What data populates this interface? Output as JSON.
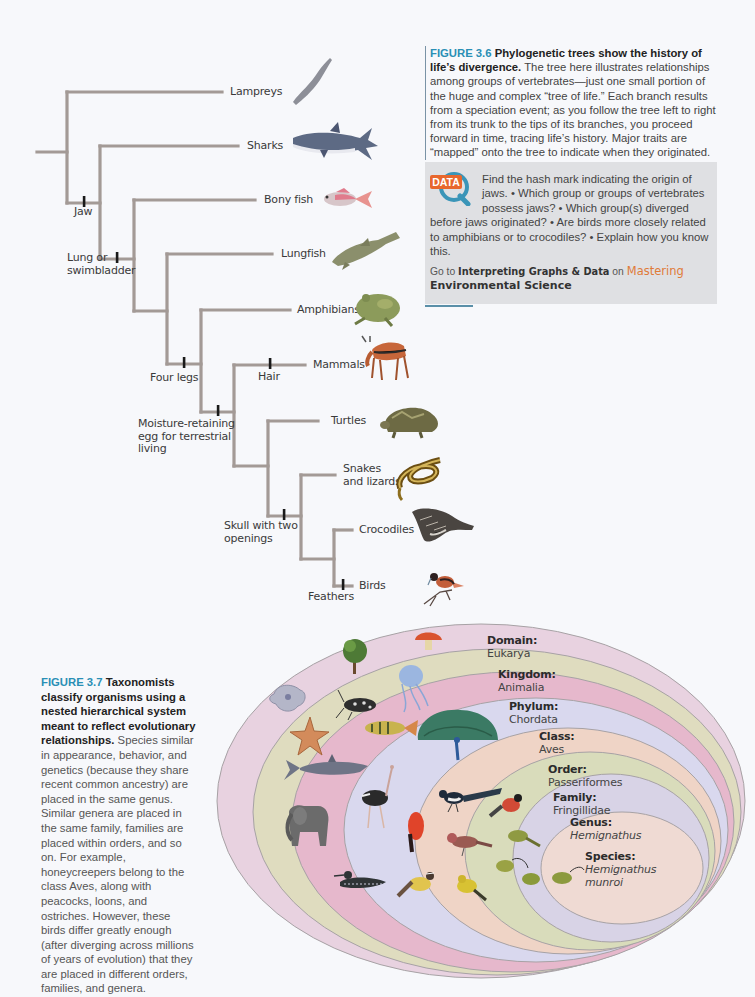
{
  "figure_3_6": {
    "number": "FIGURE 3.6",
    "title": "Phylogenetic trees show the history of life’s divergence.",
    "body": "The tree here illustrates relationships among groups of vertebrates—just one small portion of the huge and complex “tree of life.” Each branch results from a speciation event; as you follow the tree left to right from its trunk to the tips of its branches, you proceed forward in time, tracing life’s history. Major traits are “mapped” onto the tree to indicate when they originated.",
    "data_box": {
      "badge": "DATA",
      "questions": "Find the hash mark indicating the origin of jaws. • Which group or groups of vertebrates possess jaws? • Which group(s) diverged before jaws originated? • Are birds more closely related to amphibians or to crocodiles? • Explain how you know this.",
      "goto_prefix": "Go to",
      "goto_link": "Interpreting Graphs & Data",
      "goto_on": "on",
      "goto_brand": "Mastering",
      "goto_product": "Environmental Science"
    }
  },
  "tree": {
    "line_color": "#a39a96",
    "mark_color": "#1a1a1a",
    "taxa": [
      {
        "label": "Lampreys",
        "x": 230,
        "y": 85,
        "icon": "lamprey-icon"
      },
      {
        "label": "Sharks",
        "x": 247,
        "y": 139,
        "icon": "shark-icon"
      },
      {
        "label": "Bony fish",
        "x": 264,
        "y": 193,
        "icon": "bony-fish-icon"
      },
      {
        "label": "Lungfish",
        "x": 281,
        "y": 247,
        "icon": "lungfish-icon"
      },
      {
        "label": "Amphibians",
        "x": 297,
        "y": 303,
        "icon": "frog-icon"
      },
      {
        "label": "Mammals",
        "x": 313,
        "y": 358,
        "icon": "antelope-icon"
      },
      {
        "label": "Turtles",
        "x": 331,
        "y": 414,
        "icon": "turtle-icon"
      },
      {
        "label": "Snakes\nand lizards",
        "x": 343,
        "y": 462,
        "icon": "snake-icon"
      },
      {
        "label": "Crocodiles",
        "x": 359,
        "y": 523,
        "icon": "crocodile-icon"
      },
      {
        "label": "Birds",
        "x": 359,
        "y": 579,
        "icon": "bird-icon"
      }
    ],
    "traits": [
      {
        "label": "Jaw",
        "x": 74,
        "y": 206
      },
      {
        "label": "Lung or\nswimbladder",
        "x": 67,
        "y": 252
      },
      {
        "label": "Four legs",
        "x": 150,
        "y": 372
      },
      {
        "label": "Hair",
        "x": 258,
        "y": 371
      },
      {
        "label": "Moisture-retaining\negg for terrestrial\nliving",
        "x": 138,
        "y": 418
      },
      {
        "label": "Skull with two\nopenings",
        "x": 224,
        "y": 520
      },
      {
        "label": "Feathers",
        "x": 308,
        "y": 591
      }
    ],
    "segments": [
      [
        37,
        152,
        67,
        152
      ],
      [
        67,
        92,
        67,
        203
      ],
      [
        67,
        92,
        222,
        92
      ],
      [
        67,
        203,
        100,
        203
      ],
      [
        100,
        146,
        100,
        259
      ],
      [
        100,
        146,
        238,
        146
      ],
      [
        100,
        259,
        134,
        259
      ],
      [
        134,
        200,
        134,
        311
      ],
      [
        134,
        200,
        255,
        200
      ],
      [
        134,
        311,
        167,
        311
      ],
      [
        167,
        254,
        167,
        364
      ],
      [
        167,
        254,
        272,
        254
      ],
      [
        167,
        364,
        201,
        364
      ],
      [
        201,
        310,
        201,
        412
      ],
      [
        201,
        310,
        290,
        310
      ],
      [
        201,
        412,
        234,
        412
      ],
      [
        234,
        365,
        234,
        466
      ],
      [
        234,
        365,
        305,
        365
      ],
      [
        234,
        466,
        268,
        466
      ],
      [
        268,
        421,
        268,
        516
      ],
      [
        268,
        421,
        318,
        421
      ],
      [
        268,
        516,
        301,
        516
      ],
      [
        301,
        475,
        301,
        559
      ],
      [
        301,
        475,
        335,
        475
      ],
      [
        301,
        559,
        334,
        559
      ],
      [
        334,
        530,
        334,
        586
      ],
      [
        334,
        530,
        352,
        530
      ],
      [
        334,
        586,
        352,
        586
      ]
    ],
    "marks": [
      [
        84,
        203
      ],
      [
        117,
        259
      ],
      [
        184,
        364
      ],
      [
        218,
        412
      ],
      [
        270,
        365
      ],
      [
        284,
        516
      ],
      [
        343,
        586
      ]
    ]
  },
  "figure_3_7": {
    "number": "FIGURE 3.7",
    "title": "Taxonomists classify organisms using a nested hierarchical system meant to reflect evolutionary relationships.",
    "body": "Species similar in appearance, behavior, and genetics (because they share recent common ancestry) are placed in the same genus. Similar genera are placed in the same family, families are placed within orders, and so on. For example, honeycreepers belong to the class Aves, along with peacocks, loons, and ostriches. However, these birds differ greatly enough (after diverging across millions of years of evolution) that they are placed in different orders, families, and genera."
  },
  "taxonomy": {
    "levels": [
      {
        "rank": "Domain:",
        "name": "Eukarya",
        "italic": false,
        "color": "#e8d2e0",
        "x": 487,
        "y": 634
      },
      {
        "rank": "Kingdom:",
        "name": "Animalia",
        "italic": false,
        "color": "#dfdcbf",
        "x": 498,
        "y": 668
      },
      {
        "rank": "Phylum:",
        "name": "Chordata",
        "italic": false,
        "color": "#e6b8cc",
        "x": 509,
        "y": 700
      },
      {
        "rank": "Class:",
        "name": "Aves",
        "italic": false,
        "color": "#d9d8ee",
        "x": 539,
        "y": 730
      },
      {
        "rank": "Order:",
        "name": "Passeriformes",
        "italic": false,
        "color": "#efd4c6",
        "x": 548,
        "y": 763
      },
      {
        "rank": "Family:",
        "name": "Fringillidae",
        "italic": false,
        "color": "#d9dcbb",
        "x": 553,
        "y": 791
      },
      {
        "rank": "Genus:",
        "name": "Hemignathus",
        "italic": true,
        "color": "#d8d3e6",
        "x": 570,
        "y": 816
      },
      {
        "rank": "Species:",
        "name": "Hemignathus munroi",
        "italic": true,
        "color": "#efdad3",
        "x": 585,
        "y": 850
      }
    ],
    "organisms": [
      "mushroom-icon",
      "tree-icon",
      "amoeba-icon",
      "jellyfish-icon",
      "beetle-icon",
      "starfish-icon",
      "perch-icon",
      "shark-icon",
      "peacock-icon",
      "elephant-icon",
      "ostrich-icon",
      "loon-icon",
      "magpie-icon",
      "bullfinch-icon",
      "cock-of-the-rock-icon",
      "finch-icon",
      "kiskadee-icon",
      "goldfinch-icon",
      "honeycreeper-icon"
    ]
  }
}
